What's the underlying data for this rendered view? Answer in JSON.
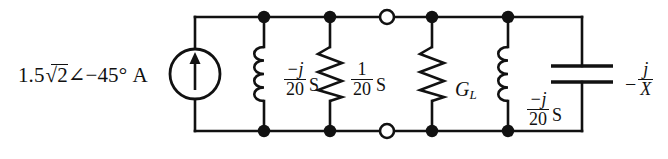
{
  "diagram": {
    "colors": {
      "line": "#111111",
      "node_fill": "#111111",
      "terminal_fill": "#ffffff",
      "background": "#ffffff"
    },
    "source": {
      "name": "current-source",
      "magnitude": "1.5",
      "radical": "2",
      "angle_symbol": "∠",
      "angle": "−45°",
      "unit": "A",
      "full_label": "1.5√2∠−45° A",
      "symbol": "circle-with-up-arrow",
      "direction": "up"
    },
    "branches": [
      {
        "name": "inductor-1",
        "symbol": "inductor",
        "numerator": "−j",
        "denominator": "20",
        "unit": "S",
        "full_label": "−j/20 S"
      },
      {
        "name": "resistor-1",
        "symbol": "resistor",
        "numerator": "1",
        "denominator": "20",
        "unit": "S",
        "full_label": "1/20 S"
      },
      {
        "name": "resistor-gl",
        "symbol": "resistor",
        "label_main": "G",
        "label_sub": "L",
        "full_label": "G_L"
      },
      {
        "name": "inductor-2",
        "symbol": "inductor",
        "numerator": "−j",
        "denominator": "20",
        "unit": "S",
        "full_label": "−j/20 S"
      },
      {
        "name": "capacitor",
        "symbol": "capacitor",
        "sign": "−",
        "numerator": "j",
        "denominator": "X",
        "full_label": "−j/X"
      }
    ],
    "terminals": {
      "name": "open-terminal-pair",
      "count": 2,
      "style": "open-circle"
    },
    "nodes": {
      "name": "junction-dots",
      "count": 8,
      "style": "filled-dot"
    }
  }
}
